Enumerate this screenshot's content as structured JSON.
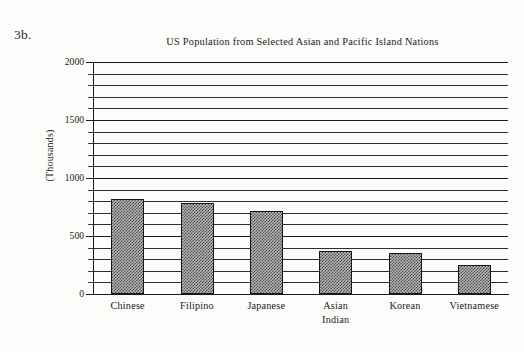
{
  "figure": {
    "label": "3b.",
    "y_axis_title": "(Thousands)"
  },
  "chart_data": {
    "type": "bar",
    "title": "US Population from Selected Asian and Pacific Island Nations",
    "xlabel": "",
    "ylabel": "(Thousands)",
    "ylim": [
      0,
      2000
    ],
    "ytick_labels": [
      "0",
      "500",
      "1000",
      "1500",
      "2000"
    ],
    "yticks": [
      0,
      500,
      1000,
      1500,
      2000
    ],
    "minor_tick_step": 100,
    "grid": true,
    "grid_axis": "y",
    "legend": false,
    "categories": [
      "Chinese",
      "Filipino",
      "Japanese",
      "Asian Indian",
      "Korean",
      "Vietnamese"
    ],
    "category_lines": [
      [
        "Chinese"
      ],
      [
        "Filipino"
      ],
      [
        "Japanese"
      ],
      [
        "Asian",
        "Indian"
      ],
      [
        "Korean"
      ],
      [
        "Vietnamese"
      ]
    ],
    "values": [
      820,
      785,
      715,
      370,
      355,
      250
    ],
    "bar_fill": "crosshatch-gray",
    "bar_edge_color": "#151515"
  }
}
